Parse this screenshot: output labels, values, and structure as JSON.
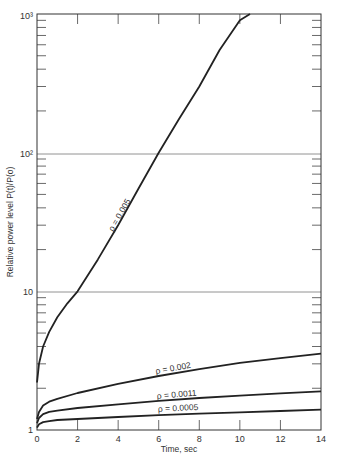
{
  "chart_data": {
    "type": "line",
    "title": "",
    "xlabel": "Time, sec",
    "ylabel": "Relative power level P(t)/P(o)",
    "xlim": [
      0,
      14
    ],
    "ylim": [
      1,
      1000
    ],
    "yscale": "log",
    "grid": "horizontal lines at 10 and 10^2",
    "x_ticks": [
      0,
      2,
      4,
      6,
      8,
      10,
      12,
      14
    ],
    "x_tick_labels": [
      "0",
      "2",
      "4",
      "6",
      "8",
      "10",
      "12",
      "14"
    ],
    "y_tick_labels": [
      "1",
      "10",
      "10²",
      "10³"
    ],
    "y_ticks": [
      1,
      10,
      100,
      1000
    ],
    "legend": "inline labels on curves",
    "series": [
      {
        "name": "ρ = 0.005",
        "x": [
          0,
          0.1,
          0.3,
          0.6,
          1.0,
          1.5,
          2.0,
          3.0,
          4.0,
          5.0,
          6.0,
          7.0,
          8.0,
          9.0,
          10.0,
          10.5
        ],
        "values": [
          2.2,
          3.0,
          4.0,
          5.1,
          6.5,
          8.2,
          10,
          17,
          30,
          55,
          100,
          175,
          300,
          550,
          900,
          1000
        ]
      },
      {
        "name": "ρ = 0.002",
        "x": [
          0,
          0.1,
          0.3,
          0.6,
          1.0,
          2.0,
          4.0,
          6.0,
          8.0,
          10.0,
          12.0,
          14.0
        ],
        "values": [
          1.2,
          1.35,
          1.5,
          1.6,
          1.68,
          1.85,
          2.15,
          2.45,
          2.75,
          3.05,
          3.3,
          3.55
        ]
      },
      {
        "name": "ρ = 0.0011",
        "x": [
          0,
          0.1,
          0.3,
          0.6,
          1.0,
          2.0,
          4.0,
          6.0,
          8.0,
          10.0,
          12.0,
          14.0
        ],
        "values": [
          1.12,
          1.22,
          1.3,
          1.35,
          1.38,
          1.44,
          1.53,
          1.62,
          1.7,
          1.77,
          1.84,
          1.9
        ]
      },
      {
        "name": "ρ = 0.0005",
        "x": [
          0,
          0.1,
          0.3,
          0.6,
          1.0,
          2.0,
          4.0,
          6.0,
          8.0,
          10.0,
          12.0,
          14.0
        ],
        "values": [
          1.04,
          1.1,
          1.14,
          1.16,
          1.18,
          1.2,
          1.24,
          1.28,
          1.31,
          1.34,
          1.37,
          1.4
        ]
      }
    ],
    "annotations": [
      {
        "text": "ρ = 0.005",
        "series": 0
      },
      {
        "text": "ρ = 0.002",
        "series": 1
      },
      {
        "text": "ρ = 0.0011",
        "series": 2
      },
      {
        "text": "ρ = 0.0005",
        "series": 3
      }
    ]
  },
  "labels": {
    "xlabel": "Time, sec",
    "ylabel": "Relative power level P(t)/P(o)",
    "y_tick_1": "1",
    "y_tick_10": "10",
    "y_tick_100": "10²",
    "y_tick_1000": "10³",
    "curve_0005": "ρ = 0.005",
    "curve_002": "ρ = 0.002",
    "curve_0011": "ρ = 0.0011",
    "curve_00005": "ρ = 0.0005"
  }
}
